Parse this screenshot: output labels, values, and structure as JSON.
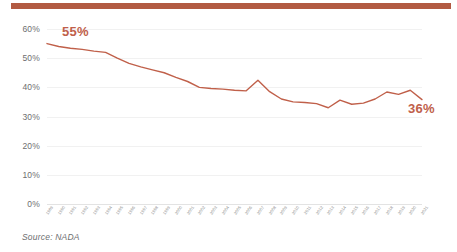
{
  "accent_bar_color": "#b25a42",
  "source_note": "Source: NADA",
  "chart_data": {
    "type": "line",
    "title": "",
    "subtitle": "",
    "xlabel": "",
    "ylabel": "",
    "ylim": [
      0,
      60
    ],
    "yticks": [
      0,
      10,
      20,
      30,
      40,
      50,
      60
    ],
    "ytick_labels": [
      "0%",
      "10%",
      "20%",
      "30%",
      "40%",
      "50%",
      "60%"
    ],
    "grid": true,
    "legend": "none",
    "line_color": "#c0604a",
    "categories": [
      "1989",
      "1990",
      "1991",
      "1992",
      "1993",
      "1994",
      "1995",
      "1996",
      "1997",
      "1998",
      "1999",
      "2000",
      "2001",
      "2002",
      "2003",
      "2004",
      "2005",
      "2006",
      "2007",
      "2008",
      "2009",
      "2010",
      "2011",
      "2012",
      "2013",
      "2014",
      "2015",
      "2016",
      "2017",
      "2018",
      "2019",
      "2020",
      "2021"
    ],
    "values": [
      55.0,
      54.0,
      53.4,
      53.0,
      52.4,
      52.0,
      50.0,
      48.2,
      47.0,
      46.0,
      45.0,
      43.4,
      42.0,
      40.0,
      39.6,
      39.4,
      39.0,
      38.8,
      42.4,
      38.5,
      36.0,
      35.0,
      34.8,
      34.4,
      33.0,
      35.6,
      34.2,
      34.6,
      36.0,
      38.4,
      37.6,
      39.0,
      35.8
    ],
    "annotations": [
      {
        "name": "start-value",
        "text": "55%",
        "x_category": "1989",
        "value": 55
      },
      {
        "name": "end-value",
        "text": "36%",
        "x_category": "2021",
        "value": 36
      }
    ]
  }
}
